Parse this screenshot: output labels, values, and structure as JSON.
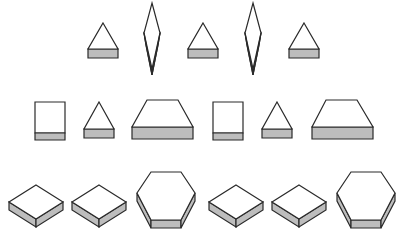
{
  "figure": {
    "colors": {
      "outline": "#2a2a2a",
      "face": "#ffffff",
      "shade": "#bdbdbd",
      "background": "#ffffff"
    },
    "rows": [
      {
        "name": "row-1",
        "shapes": [
          {
            "type": "triangle-prism",
            "cx": 103,
            "apex_y": 23,
            "half_w": 15,
            "base_top": 49,
            "base_bot": 58
          },
          {
            "type": "diamond-prism",
            "cx": 152,
            "top_y": 3,
            "mid_y": 33,
            "half_w": 8,
            "bot_y": 75
          },
          {
            "type": "triangle-prism",
            "cx": 203,
            "apex_y": 23,
            "half_w": 15,
            "base_top": 49,
            "base_bot": 58
          },
          {
            "type": "diamond-prism",
            "cx": 253,
            "top_y": 3,
            "mid_y": 33,
            "half_w": 8,
            "bot_y": 75
          },
          {
            "type": "triangle-prism",
            "cx": 304,
            "apex_y": 23,
            "half_w": 15,
            "base_top": 49,
            "base_bot": 58
          }
        ]
      },
      {
        "name": "row-2",
        "shapes": [
          {
            "type": "rect-prism",
            "x": 35,
            "y": 102,
            "w": 30,
            "h": 38,
            "shade_top": 133
          },
          {
            "type": "triangle-prism",
            "cx": 99,
            "apex_y": 102,
            "half_w": 15,
            "base_top": 129,
            "base_bot": 138
          },
          {
            "type": "trapezoid-prism",
            "top_l": 147,
            "top_r": 178,
            "top_y": 100,
            "bot_l": 132,
            "bot_r": 193,
            "base_top": 127,
            "base_bot": 139
          },
          {
            "type": "rect-prism",
            "x": 213,
            "y": 102,
            "w": 30,
            "h": 38,
            "shade_top": 133
          },
          {
            "type": "triangle-prism",
            "cx": 277,
            "apex_y": 102,
            "half_w": 15,
            "base_top": 129,
            "base_bot": 138
          },
          {
            "type": "trapezoid-prism",
            "top_l": 326,
            "top_r": 357,
            "top_y": 100,
            "bot_l": 312,
            "bot_r": 373,
            "base_top": 127,
            "base_bot": 139
          }
        ]
      },
      {
        "name": "row-3",
        "shapes": [
          {
            "type": "iso-box",
            "cx": 36,
            "top_y": 185,
            "half_w": 27,
            "half_h": 17,
            "thick": 8
          },
          {
            "type": "iso-box",
            "cx": 99,
            "top_y": 185,
            "half_w": 27,
            "half_h": 17,
            "thick": 8
          },
          {
            "type": "hex-prism",
            "cx": 166,
            "top_y": 172,
            "top_half": 15,
            "mid_half": 29,
            "mid_y": 201,
            "bot_y": 228,
            "thick": 8
          },
          {
            "type": "iso-box",
            "cx": 236,
            "top_y": 185,
            "half_w": 27,
            "half_h": 17,
            "thick": 8
          },
          {
            "type": "iso-box",
            "cx": 299,
            "top_y": 185,
            "half_w": 27,
            "half_h": 17,
            "thick": 8
          },
          {
            "type": "hex-prism",
            "cx": 366,
            "top_y": 172,
            "top_half": 15,
            "mid_half": 29,
            "mid_y": 201,
            "bot_y": 228,
            "thick": 8
          }
        ]
      }
    ]
  }
}
